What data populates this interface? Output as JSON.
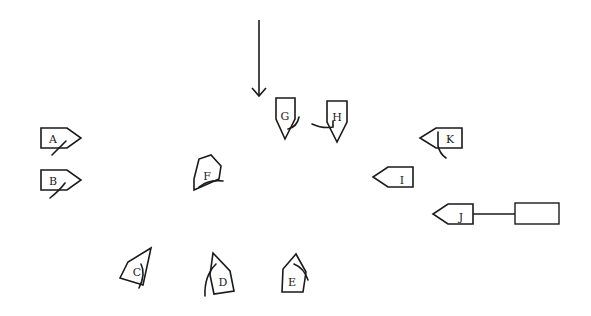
{
  "diagram": {
    "colors": {
      "ink": "#1a1a1a",
      "background": "#ffffff"
    },
    "wind_arrow": {
      "x": 259,
      "y_start": 20,
      "y_end": 96,
      "direction": "down"
    },
    "boats": [
      {
        "id": "A",
        "label": "A",
        "cx": 60,
        "cy": 138,
        "heading": 0
      },
      {
        "id": "B",
        "label": "B",
        "cx": 60,
        "cy": 180,
        "heading": 0
      },
      {
        "id": "C",
        "label": "C",
        "cx": 136,
        "cy": 270,
        "heading": -55
      },
      {
        "id": "D",
        "label": "D",
        "cx": 220,
        "cy": 276,
        "heading": -110
      },
      {
        "id": "E",
        "label": "E",
        "cx": 292,
        "cy": 276,
        "heading": -90
      },
      {
        "id": "F",
        "label": "F",
        "cx": 206,
        "cy": 175,
        "heading": -60
      },
      {
        "id": "G",
        "label": "G",
        "cx": 285,
        "cy": 117,
        "heading": 90
      },
      {
        "id": "H",
        "label": "H",
        "cx": 337,
        "cy": 120,
        "heading": 90
      },
      {
        "id": "I",
        "label": "I",
        "cx": 394,
        "cy": 177,
        "heading": 180
      },
      {
        "id": "J",
        "label": "J",
        "cx": 454,
        "cy": 214,
        "heading": 180
      },
      {
        "id": "K",
        "label": "K",
        "cx": 442,
        "cy": 138,
        "heading": 180
      }
    ],
    "tow_line": {
      "from_boat": "J",
      "x1": 473,
      "x2": 515,
      "y": 214
    },
    "mark_rectangle": {
      "x": 515,
      "y": 203,
      "width": 44,
      "height": 21
    }
  }
}
